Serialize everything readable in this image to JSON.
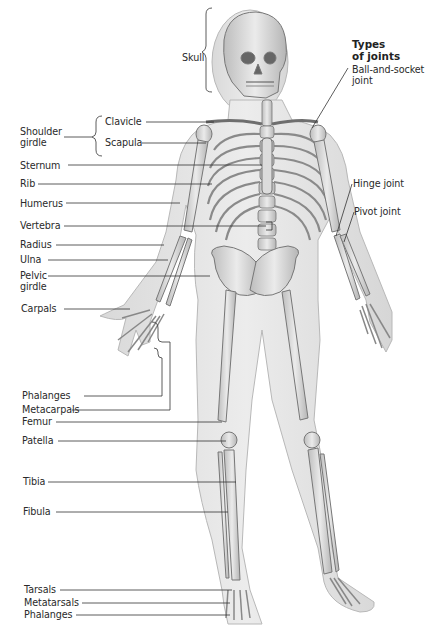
{
  "header": {
    "types_of_joints_line1": "Types",
    "types_of_joints_line2": "of joints"
  },
  "labels": {
    "skull": "Skull",
    "shoulder_girdle_line1": "Shoulder",
    "shoulder_girdle_line2": "girdle",
    "clavicle": "Clavicle",
    "scapula": "Scapula",
    "sternum": "Sternum",
    "rib": "Rib",
    "humerus": "Humerus",
    "vertebra": "Vertebra",
    "radius": "Radius",
    "ulna": "Ulna",
    "pelvic_girdle_line1": "Pelvic",
    "pelvic_girdle_line2": "girdle",
    "carpals": "Carpals",
    "phalanges_hand": "Phalanges",
    "metacarpals": "Metacarpals",
    "femur": "Femur",
    "patella": "Patella",
    "tibia": "Tibia",
    "fibula": "Fibula",
    "tarsals": "Tarsals",
    "metatarsals": "Metatarsals",
    "phalanges_foot": "Phalanges"
  },
  "joints": {
    "ball_and_socket_line1": "Ball-and-socket",
    "ball_and_socket_line2": "joint",
    "hinge": "Hinge joint",
    "pivot": "Pivot joint"
  },
  "colors": {
    "skin": "#e4e4e4",
    "skin_edge": "#b8b8b8",
    "bone": "#d2d2d2",
    "bone_edge": "#7a7a7a",
    "leader": "#333333"
  }
}
